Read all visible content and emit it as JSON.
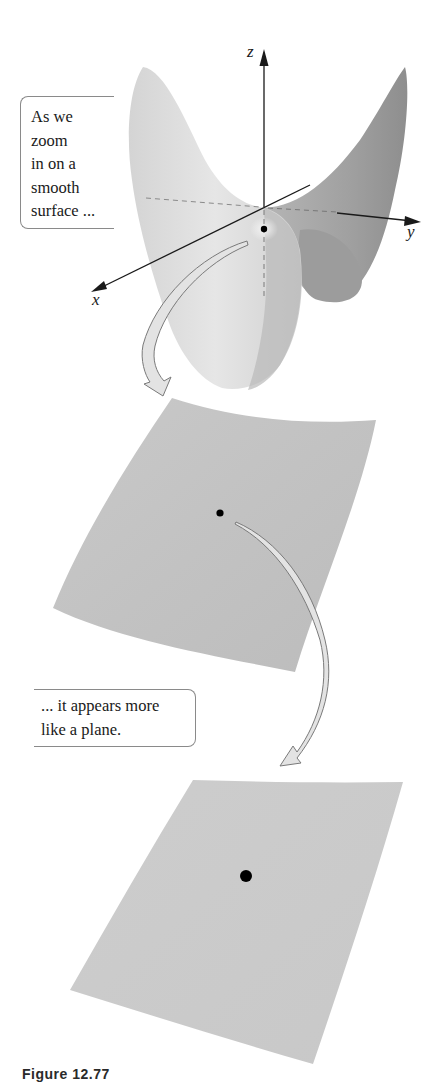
{
  "figure": {
    "caption": "Figure 12.77",
    "callouts": [
      {
        "lines": [
          "As we",
          "zoom",
          "in on a",
          "smooth",
          "surface ..."
        ]
      },
      {
        "lines": [
          "... it appears more",
          "like a plane."
        ]
      }
    ],
    "axes": {
      "x_label": "x",
      "y_label": "y",
      "z_label": "z"
    },
    "panels": [
      {
        "name": "saddle-surface",
        "description": "smooth saddle surface with 3D axes"
      },
      {
        "name": "zoomed-surface",
        "description": "zoomed-in curved patch"
      },
      {
        "name": "plane-like-surface",
        "description": "further zoomed, nearly flat patch"
      }
    ],
    "colors": {
      "surface_light": "#dcdcdc",
      "surface_mid": "#c4c4c4",
      "surface_dark": "#9a9a9a",
      "arrow_fill": "#e2e2e2",
      "arrow_stroke": "#7a7a7a",
      "point": "#000000"
    }
  }
}
